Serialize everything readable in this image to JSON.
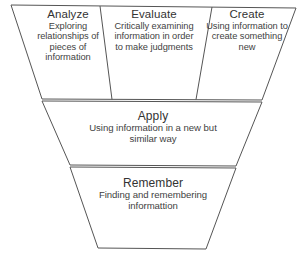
{
  "diagram": {
    "shape": "inverted-pyramid",
    "stroke_color": "#555555",
    "fill_color": "#ffffff",
    "text_color": "#3f3f3f",
    "levels": [
      {
        "id": "analyze",
        "title": "Analyze",
        "description": "Exploring relationships of pieces of information",
        "row": 1,
        "column": 1
      },
      {
        "id": "evaluate",
        "title": "Evaluate",
        "description": "Critically examining information in order to  make judgments",
        "row": 1,
        "column": 2
      },
      {
        "id": "create",
        "title": "Create",
        "description": "Using information to create something new",
        "row": 1,
        "column": 3
      },
      {
        "id": "apply",
        "title": "Apply",
        "description": "Using information in a new but similar way",
        "row": 2,
        "column": 1
      },
      {
        "id": "remember",
        "title": "Remember",
        "description": "Finding and remembering informattion",
        "row": 3,
        "column": 1
      }
    ]
  }
}
